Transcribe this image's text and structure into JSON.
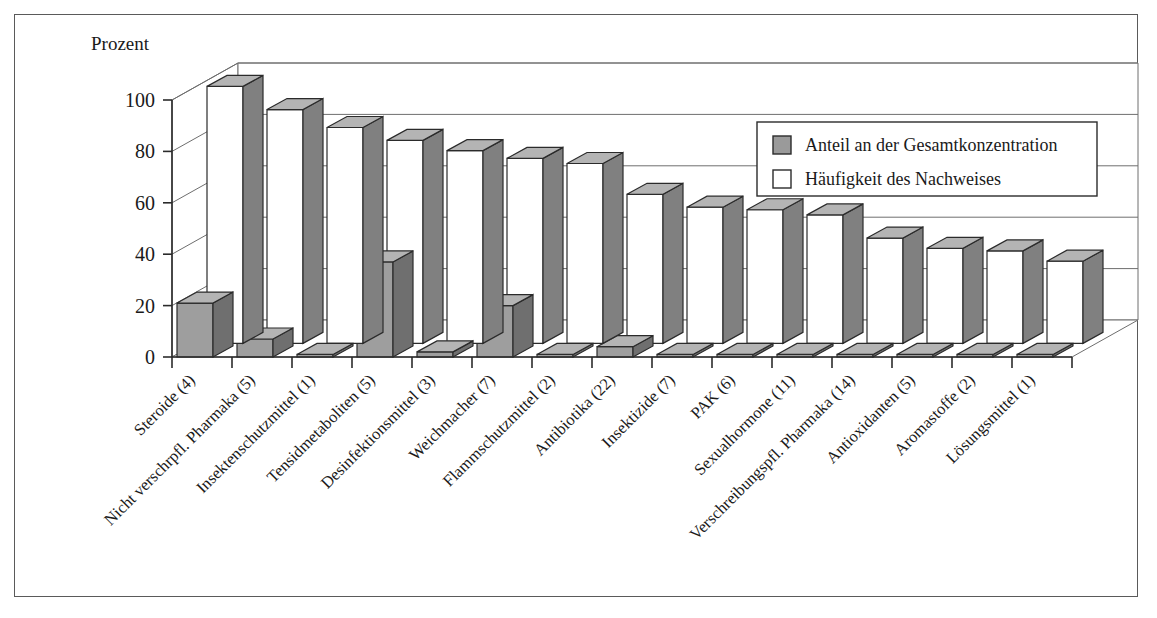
{
  "figure": {
    "axis_title": "Prozent",
    "frame_color": "#5a5a5a"
  },
  "legend": {
    "entries": [
      {
        "label": "Anteil an der Gesamtkonzentration",
        "color": "#9a9a9a",
        "swatch": "filled-gray"
      },
      {
        "label": "Häufigkeit des Nachweises",
        "color": "#ffffff",
        "swatch": "outline-white"
      }
    ]
  },
  "chart_data": {
    "type": "bar",
    "title": "",
    "subtitle": "",
    "xlabel": "",
    "ylabel": "Prozent",
    "ylim": [
      0,
      100
    ],
    "yticks": [
      0,
      20,
      40,
      60,
      80,
      100
    ],
    "ytick_labels": [
      "0",
      "20",
      "40",
      "60",
      "80",
      "100"
    ],
    "grid": true,
    "legend_position": "upper-right",
    "style": "3d-grouped-column",
    "categories": [
      "Steroide (4)",
      "Nicht verschrpfl. Pharmaka (5)",
      "Insektenschutzmittel (1)",
      "Tensidmetaboliten (5)",
      "Desinfektionsmittel (3)",
      "Weichmacher (7)",
      "Flammschutzmittel (2)",
      "Antibiotika (22)",
      "Insektizide (7)",
      "PAK (6)",
      "Sexualhormone (11)",
      "Verschreibungspfl. Pharmaka (14)",
      "Antioxidanten (5)",
      "Aromastoffe (2)",
      "Lösungsmittel (1)"
    ],
    "series": [
      {
        "name": "Anteil an der Gesamtkonzentration",
        "color": "#9a9a9a",
        "values": [
          21,
          7,
          1,
          37,
          2,
          20,
          1,
          4,
          1,
          1,
          1,
          1,
          1,
          1,
          1
        ]
      },
      {
        "name": "Häufigkeit des Nachweises",
        "color": "#ffffff",
        "values": [
          100,
          91,
          84,
          79,
          75,
          72,
          70,
          58,
          53,
          52,
          50,
          41,
          37,
          36,
          32
        ]
      }
    ]
  }
}
